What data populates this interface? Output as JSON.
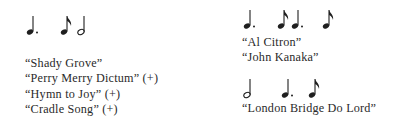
{
  "left": {
    "rhythm": {
      "notes": [
        {
          "type": "dotted-quarter",
          "x": 26
        },
        {
          "type": "eighth",
          "x": 60
        },
        {
          "type": "half",
          "x": 77
        }
      ]
    },
    "songs": [
      {
        "title": "“Shady Grove”",
        "mark": ""
      },
      {
        "title": "“Perry Merry Dictum”",
        "mark": "(+)"
      },
      {
        "title": "“Hymn to Joy”",
        "mark": "(+)"
      },
      {
        "title": "“Cradle Song”",
        "mark": "(+)"
      }
    ]
  },
  "right": {
    "rhythm1": {
      "notes": [
        {
          "type": "dotted-quarter",
          "x": 243
        },
        {
          "type": "eighth",
          "x": 277
        },
        {
          "type": "dotted-quarter",
          "x": 291
        },
        {
          "type": "eighth",
          "x": 322
        }
      ]
    },
    "songs1": [
      {
        "title": "“Al Citron”",
        "mark": ""
      },
      {
        "title": "“John Kanaka”",
        "mark": ""
      }
    ],
    "rhythm2": {
      "notes": [
        {
          "type": "half",
          "x": 243
        },
        {
          "type": "dotted-quarter",
          "x": 281
        },
        {
          "type": "eighth",
          "x": 308
        }
      ]
    },
    "songs2": [
      {
        "title": "“London Bridge Do Lord”",
        "mark": ""
      }
    ]
  }
}
